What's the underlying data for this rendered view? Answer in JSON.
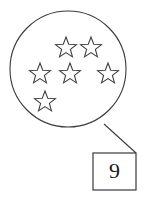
{
  "figure": {
    "type": "counting-set-illustration",
    "stroke_color": "#3a3a3a",
    "fill_color": "#ffffff",
    "text_color": "#1a1a1a",
    "background_color": "#ffffff"
  },
  "circle": {
    "name": "set-circle",
    "cx": 68,
    "cy": 69,
    "r": 58
  },
  "stars": {
    "count": 6,
    "shape": "five-pointed-star-outline",
    "items": [
      {
        "label": "star-1",
        "cx": 66,
        "cy": 48,
        "r": 11
      },
      {
        "label": "star-2",
        "cx": 91,
        "cy": 48,
        "r": 11
      },
      {
        "label": "star-3",
        "cx": 40,
        "cy": 74,
        "r": 11
      },
      {
        "label": "star-4",
        "cx": 70,
        "cy": 74,
        "r": 11
      },
      {
        "label": "star-5",
        "cx": 108,
        "cy": 74,
        "r": 11
      },
      {
        "label": "star-6",
        "cx": 45,
        "cy": 102,
        "r": 11
      }
    ]
  },
  "leader_line": {
    "name": "leader-line",
    "x1": 104,
    "y1": 124,
    "x2": 136,
    "y2": 153
  },
  "answer_box": {
    "name": "answer-box",
    "x": 93,
    "y": 153,
    "width": 43,
    "height": 37,
    "value": "9"
  }
}
